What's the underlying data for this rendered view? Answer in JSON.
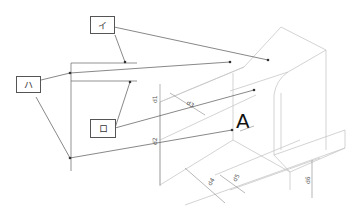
{
  "labels": {
    "i": "イ",
    "ro": "ロ",
    "ha": "ハ"
  },
  "view_marker": "A",
  "dimensions": {
    "d1": "d1",
    "d2": "d2",
    "d3": "d3",
    "d4": "d4",
    "d5": "d5",
    "d6": "d6"
  },
  "colors": {
    "outline": "#c8c8c8",
    "leader": "#555555",
    "box_border": "#555555"
  }
}
